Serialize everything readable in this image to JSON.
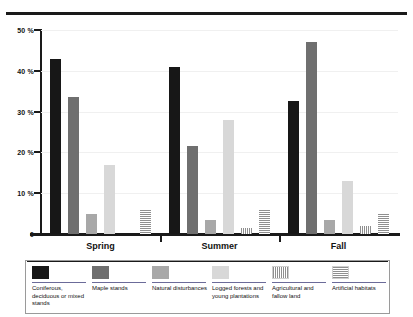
{
  "chart_data": {
    "type": "bar",
    "title": "",
    "xlabel": "",
    "ylabel": "",
    "ylim": [
      0,
      50
    ],
    "grid": true,
    "legend_position": "bottom",
    "categories": [
      "Spring",
      "Summer",
      "Fall"
    ],
    "y_ticks": [
      "0",
      "10 %",
      "20 %",
      "30 %",
      "40 %",
      "50 %"
    ],
    "y_tick_values": [
      0,
      10,
      20,
      30,
      40,
      50
    ],
    "series": [
      {
        "name": "Coniferous, deciduous or mixed stands",
        "values": [
          43,
          41,
          32.5
        ],
        "swatch": "solid-black"
      },
      {
        "name": "Maple stands",
        "values": [
          33.5,
          21.5,
          47
        ],
        "swatch": "solid-dark-gray"
      },
      {
        "name": "Natural disturbances",
        "values": [
          5,
          3.5,
          3.5
        ],
        "swatch": "solid-medium-gray"
      },
      {
        "name": "Logged forests and young plantations",
        "values": [
          17,
          28,
          13
        ],
        "swatch": "solid-light-gray"
      },
      {
        "name": "Agricultural and fallow land",
        "values": [
          0,
          1.5,
          2
        ],
        "swatch": "vertical-stripes"
      },
      {
        "name": "Artificial habitats",
        "values": [
          6,
          6,
          5
        ],
        "swatch": "horizontal-stripes"
      }
    ]
  },
  "legend": {
    "items": [
      {
        "label": "Coniferous, deciduous or mixed stands"
      },
      {
        "label": "Maple stands"
      },
      {
        "label": "Natural disturbances"
      },
      {
        "label": "Logged forests and young plantations"
      },
      {
        "label": "Agricultural and fallow land"
      },
      {
        "label": "Artificial habitats"
      }
    ]
  },
  "colors": {
    "series0": "#171717",
    "series1": "#6f6f6f",
    "series2": "#a8a8a8",
    "series3": "#d8d8d8",
    "axis": "#1a1a1a",
    "grid": "#f0f0f0"
  }
}
